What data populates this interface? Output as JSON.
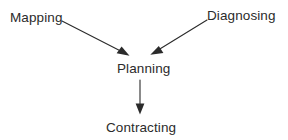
{
  "diagram": {
    "background_color": "#ffffff",
    "stroke_color": "#2b2b2b",
    "text_color": "#2b2b2b",
    "nodes": [
      {
        "id": "mapping",
        "label": "Mapping",
        "x": 10,
        "y": 10
      },
      {
        "id": "diagnosing",
        "label": "Diagnosing",
        "x": 207,
        "y": 8
      },
      {
        "id": "planning",
        "label": "Planning",
        "x": 117,
        "y": 61
      },
      {
        "id": "contracting",
        "label": "Contracting",
        "x": 106,
        "y": 120
      }
    ],
    "edges": [
      {
        "id": "mapping-to-planning",
        "from": "mapping",
        "to": "planning",
        "x1": 62,
        "y1": 21,
        "x2": 128,
        "y2": 55,
        "arrowhead": "filled-triangle"
      },
      {
        "id": "diagnosing-to-planning",
        "from": "diagnosing",
        "to": "planning",
        "x1": 207,
        "y1": 20,
        "x2": 152,
        "y2": 54,
        "arrowhead": "filled-triangle"
      },
      {
        "id": "planning-to-contracting",
        "from": "planning",
        "to": "contracting",
        "x1": 140,
        "y1": 80,
        "x2": 140,
        "y2": 114,
        "arrowhead": "filled-triangle"
      }
    ]
  }
}
